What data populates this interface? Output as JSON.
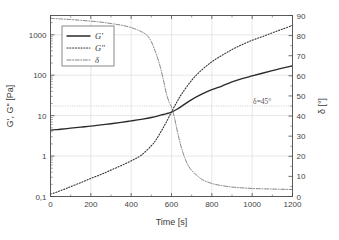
{
  "chart_data": {
    "type": "line",
    "title": "",
    "subtitle": "",
    "xlabel": "Time [s]",
    "ylabel": "G', G'' [Pa]",
    "y2label": "δ [°]",
    "xlim": [
      0,
      1200
    ],
    "ylim": [
      0.1,
      3000
    ],
    "y2lim": [
      0,
      90
    ],
    "yscale": "log",
    "xscale": "linear",
    "grid": true,
    "legend_position": "upper-left",
    "xticks": [
      0,
      200,
      400,
      600,
      800,
      1000,
      1200
    ],
    "xticklabels": [
      "0",
      "200",
      "400",
      "600",
      "800",
      "1000",
      "1200"
    ],
    "yticks": [
      0.1,
      1,
      10,
      100,
      1000
    ],
    "yticklabels": [
      "0,1",
      "1",
      "10",
      "100",
      "1000"
    ],
    "y2ticks": [
      0,
      10,
      20,
      30,
      40,
      50,
      60,
      70,
      80,
      90
    ],
    "y2ticklabels": [
      "0",
      "10",
      "20",
      "30",
      "40",
      "50",
      "60",
      "70",
      "80",
      "90"
    ],
    "annotations": [
      {
        "text": "δ=45°",
        "x": 1050,
        "y2": 45,
        "reference_line": {
          "axis": "y2",
          "value": 45,
          "style": "dotted"
        }
      }
    ],
    "series": [
      {
        "name": "G'",
        "label": "G'",
        "axis": "left",
        "style": "solid",
        "color": "#2a2a2a",
        "x": [
          0,
          25,
          50,
          100,
          150,
          200,
          250,
          300,
          350,
          400,
          450,
          500,
          550,
          575,
          600,
          625,
          650,
          700,
          750,
          800,
          850,
          900,
          950,
          1000,
          1050,
          1100,
          1150,
          1200
        ],
        "y": [
          4.4,
          4.5,
          4.6,
          4.9,
          5.2,
          5.5,
          5.9,
          6.3,
          6.8,
          7.4,
          8.1,
          9.0,
          10.4,
          11.2,
          12.3,
          14.2,
          17.0,
          25.0,
          34.0,
          44.0,
          54.0,
          68.0,
          82.0,
          96.0,
          112.0,
          130.0,
          150.0,
          170.0
        ]
      },
      {
        "name": "G''",
        "label": "G''",
        "axis": "left",
        "style": "dotted",
        "color": "#353535",
        "x": [
          0,
          25,
          50,
          75,
          100,
          150,
          200,
          250,
          300,
          350,
          400,
          450,
          500,
          525,
          550,
          575,
          600,
          625,
          650,
          700,
          750,
          800,
          850,
          900,
          950,
          1000,
          1050,
          1100,
          1150,
          1200
        ],
        "y": [
          0.115,
          0.125,
          0.14,
          0.155,
          0.175,
          0.22,
          0.28,
          0.35,
          0.45,
          0.58,
          0.76,
          1.05,
          1.8,
          2.6,
          4.2,
          7.0,
          12.3,
          21.0,
          34.0,
          75.0,
          135.0,
          215.0,
          310.0,
          430.0,
          570.0,
          730.0,
          900.0,
          1120.0,
          1380.0,
          1700.0
        ]
      },
      {
        "name": "δ",
        "label": "δ",
        "axis": "right",
        "style": "dashdot",
        "color": "#6d6d6d",
        "x": [
          0,
          50,
          100,
          150,
          200,
          250,
          300,
          350,
          400,
          450,
          480,
          500,
          520,
          540,
          560,
          575,
          590,
          600,
          615,
          630,
          650,
          675,
          700,
          750,
          800,
          850,
          900,
          950,
          1000,
          1100,
          1200
        ],
        "y": [
          88.6,
          88.3,
          88.0,
          87.6,
          87.2,
          86.7,
          86.0,
          85.2,
          84.0,
          82.0,
          80.0,
          77.0,
          72.0,
          66.0,
          58.0,
          51.0,
          46.5,
          44.5,
          39.0,
          32.0,
          24.0,
          17.0,
          13.0,
          8.6,
          6.5,
          5.4,
          4.7,
          4.3,
          4.0,
          3.7,
          3.5
        ]
      }
    ],
    "legend_entries": [
      "G'",
      "G''",
      "δ"
    ]
  }
}
